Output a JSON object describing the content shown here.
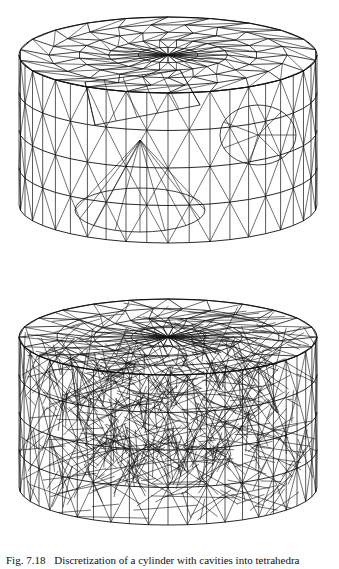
{
  "figures": [
    {
      "id": "top",
      "description": "Wireframe tetrahedral surface mesh of a cylinder with cavities",
      "stroke_color": "#111111"
    },
    {
      "id": "bottom",
      "description": "Dense wireframe tetrahedral volume mesh of the cylinder",
      "stroke_color": "#111111"
    }
  ],
  "caption": {
    "label": "Fig. 7.18",
    "text": "Discretization of a cylinder with cavities into tetrahedra"
  }
}
